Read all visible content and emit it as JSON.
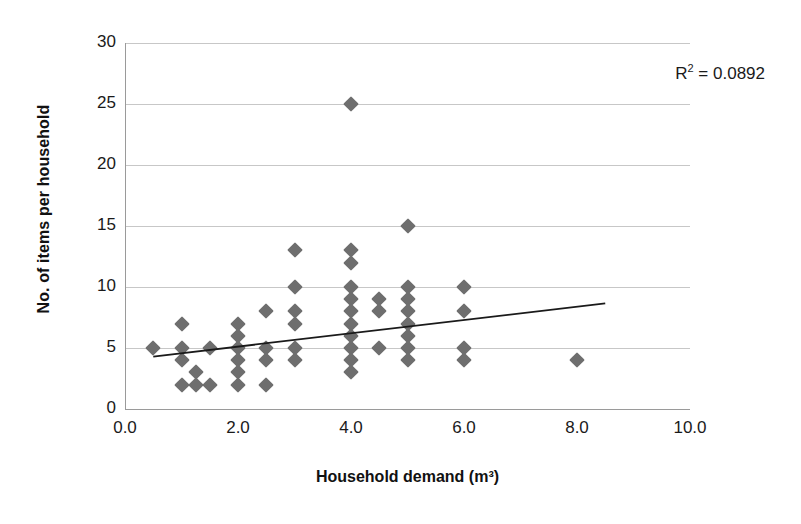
{
  "chart_data": {
    "type": "scatter",
    "title": "",
    "xlabel": "Household demand (m³)",
    "ylabel": "No. of items per household",
    "xlim": [
      0.0,
      10.0
    ],
    "ylim": [
      0,
      30
    ],
    "xticks": [
      "0.0",
      "2.0",
      "4.0",
      "6.0",
      "8.0",
      "10.0"
    ],
    "xtick_values": [
      0.0,
      2.0,
      4.0,
      6.0,
      8.0,
      10.0
    ],
    "yticks": [
      "0",
      "5",
      "10",
      "15",
      "20",
      "25",
      "30"
    ],
    "ytick_values": [
      0,
      5,
      10,
      15,
      20,
      25,
      30
    ],
    "grid": "horizontal",
    "legend": "none",
    "marker": "diamond",
    "marker_color": "#6e6e6e",
    "annotations": [
      {
        "name": "r-squared",
        "text_prefix": "R",
        "text_sup": "2",
        "text_suffix": " = 0.0892",
        "value": 0.0892
      }
    ],
    "points": [
      {
        "x": 0.5,
        "y": 5
      },
      {
        "x": 1.0,
        "y": 7
      },
      {
        "x": 1.0,
        "y": 5
      },
      {
        "x": 1.0,
        "y": 4
      },
      {
        "x": 1.0,
        "y": 2
      },
      {
        "x": 1.25,
        "y": 3
      },
      {
        "x": 1.25,
        "y": 2
      },
      {
        "x": 1.5,
        "y": 5
      },
      {
        "x": 1.5,
        "y": 2
      },
      {
        "x": 2.0,
        "y": 7
      },
      {
        "x": 2.0,
        "y": 6
      },
      {
        "x": 2.0,
        "y": 5
      },
      {
        "x": 2.0,
        "y": 4
      },
      {
        "x": 2.0,
        "y": 3
      },
      {
        "x": 2.0,
        "y": 2
      },
      {
        "x": 2.5,
        "y": 8
      },
      {
        "x": 2.5,
        "y": 5
      },
      {
        "x": 2.5,
        "y": 4
      },
      {
        "x": 2.5,
        "y": 2
      },
      {
        "x": 3.0,
        "y": 13
      },
      {
        "x": 3.0,
        "y": 10
      },
      {
        "x": 3.0,
        "y": 8
      },
      {
        "x": 3.0,
        "y": 7
      },
      {
        "x": 3.0,
        "y": 5
      },
      {
        "x": 3.0,
        "y": 4
      },
      {
        "x": 4.0,
        "y": 25
      },
      {
        "x": 4.0,
        "y": 13
      },
      {
        "x": 4.0,
        "y": 12
      },
      {
        "x": 4.0,
        "y": 10
      },
      {
        "x": 4.0,
        "y": 9
      },
      {
        "x": 4.0,
        "y": 8
      },
      {
        "x": 4.0,
        "y": 7
      },
      {
        "x": 4.0,
        "y": 6
      },
      {
        "x": 4.0,
        "y": 5
      },
      {
        "x": 4.0,
        "y": 4
      },
      {
        "x": 4.0,
        "y": 3
      },
      {
        "x": 4.5,
        "y": 9
      },
      {
        "x": 4.5,
        "y": 8
      },
      {
        "x": 4.5,
        "y": 5
      },
      {
        "x": 5.0,
        "y": 15
      },
      {
        "x": 5.0,
        "y": 10
      },
      {
        "x": 5.0,
        "y": 9
      },
      {
        "x": 5.0,
        "y": 8
      },
      {
        "x": 5.0,
        "y": 7
      },
      {
        "x": 5.0,
        "y": 6
      },
      {
        "x": 5.0,
        "y": 5
      },
      {
        "x": 5.0,
        "y": 4
      },
      {
        "x": 6.0,
        "y": 10
      },
      {
        "x": 6.0,
        "y": 8
      },
      {
        "x": 6.0,
        "y": 5
      },
      {
        "x": 6.0,
        "y": 4
      },
      {
        "x": 8.0,
        "y": 4
      }
    ],
    "trendline": {
      "name": "linear-fit",
      "x_start": 0.5,
      "y_start": 4.3,
      "x_end": 8.5,
      "y_end": 8.65,
      "color": "#1a1a1a"
    }
  }
}
